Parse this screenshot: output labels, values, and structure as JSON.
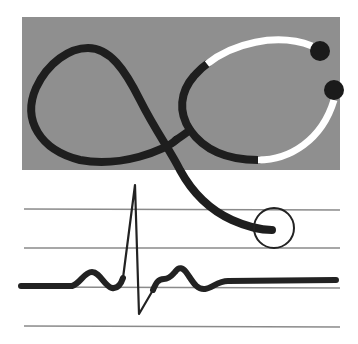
{
  "logo": {
    "description": "Stethoscope over ECG heartbeat trace",
    "colors": {
      "background": "#ffffff",
      "panel": "#8f8f8f",
      "tube": "#1e1e1e",
      "earpiece_tube": "#ffffff",
      "grid_line": "#8a8a8a",
      "ecg_trace": "#222222"
    },
    "panel": {
      "x": 22,
      "y": 17,
      "width": 318,
      "height": 153
    },
    "grid_lines_y": [
      209,
      248,
      287,
      326
    ],
    "chest_piece": {
      "cx": 274,
      "cy": 228,
      "r": 20
    },
    "ear_tips": [
      {
        "cx": 320,
        "cy": 51
      },
      {
        "cx": 334,
        "cy": 90
      }
    ]
  }
}
